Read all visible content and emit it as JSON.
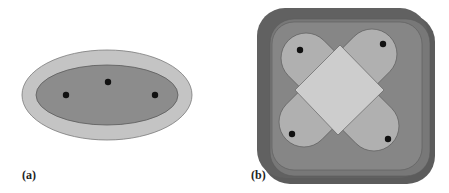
{
  "figure": {
    "panels": [
      {
        "id": "a",
        "label": "(a)",
        "shapes": {
          "outer_ellipse": {
            "cx": 107,
            "cy": 95,
            "rx": 85,
            "ry": 45,
            "fill": "#c4c4c4",
            "stroke": "#7a7a7a"
          },
          "inner_ellipse": {
            "cx": 107,
            "cy": 95,
            "rx": 71,
            "ry": 30,
            "fill": "#8c8c8c",
            "stroke": "#5a5a5a"
          }
        },
        "points": [
          {
            "x": 66,
            "y": 95
          },
          {
            "x": 108,
            "y": 82
          },
          {
            "x": 155,
            "y": 95
          }
        ]
      },
      {
        "id": "b",
        "label": "(b)",
        "shapes": {
          "outer_square_dark": {
            "x": 257,
            "y": 8,
            "w": 176,
            "h": 176,
            "r": 28,
            "fill": "#595959"
          },
          "outer_square_mid": {
            "x": 268,
            "y": 18,
            "w": 158,
            "h": 156,
            "r": 24,
            "fill": "#747474"
          },
          "capsule_1": {
            "angle": 45,
            "fill": "#b2b2b2"
          },
          "capsule_2": {
            "angle": -45,
            "fill": "#b2b2b2"
          },
          "center_diamond": {
            "fill": "#cfcfcf"
          }
        },
        "points": [
          {
            "x": 300,
            "y": 50
          },
          {
            "x": 383,
            "y": 44
          },
          {
            "x": 292,
            "y": 134
          },
          {
            "x": 388,
            "y": 139
          }
        ]
      }
    ],
    "colors": {
      "point": "#111111",
      "background": "#ffffff",
      "label": "#222222"
    }
  }
}
